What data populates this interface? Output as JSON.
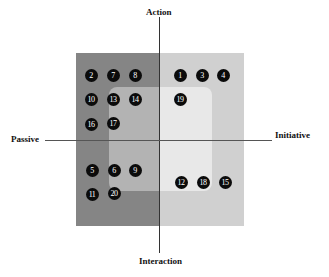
{
  "diagram": {
    "axes": {
      "top": "Action",
      "bottom": "Interaction",
      "left": "Passive",
      "right": "Initiative"
    },
    "colors": {
      "outer_left": "#858585",
      "outer_right": "#d0d0d0",
      "inner_left": "#b3b3b3",
      "inner_right": "#e8e8e8",
      "dot": "#0b0b0b",
      "dot_text": "#ffffff"
    },
    "points": [
      {
        "id": "2",
        "x": 91,
        "y": 75
      },
      {
        "id": "7",
        "x": 113,
        "y": 75
      },
      {
        "id": "8",
        "x": 135,
        "y": 75
      },
      {
        "id": "1",
        "x": 180,
        "y": 75
      },
      {
        "id": "3",
        "x": 202,
        "y": 75
      },
      {
        "id": "4",
        "x": 223,
        "y": 75
      },
      {
        "id": "10",
        "x": 91,
        "y": 99
      },
      {
        "id": "13",
        "x": 113,
        "y": 99
      },
      {
        "id": "14",
        "x": 135,
        "y": 99
      },
      {
        "id": "19",
        "x": 180,
        "y": 99
      },
      {
        "id": "16",
        "x": 91,
        "y": 124
      },
      {
        "id": "17",
        "x": 113,
        "y": 123
      },
      {
        "id": "5",
        "x": 92,
        "y": 170
      },
      {
        "id": "6",
        "x": 114,
        "y": 170
      },
      {
        "id": "9",
        "x": 135,
        "y": 170
      },
      {
        "id": "11",
        "x": 92,
        "y": 194
      },
      {
        "id": "20",
        "x": 114,
        "y": 193
      },
      {
        "id": "12",
        "x": 181,
        "y": 182
      },
      {
        "id": "18",
        "x": 203,
        "y": 182
      },
      {
        "id": "15",
        "x": 225,
        "y": 182
      }
    ]
  }
}
